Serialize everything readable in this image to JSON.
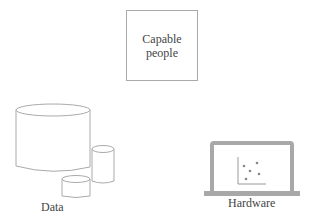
{
  "nodes": {
    "people": {
      "line1": "Capable",
      "line2": "people"
    },
    "data": {
      "label": "Data"
    },
    "hardware": {
      "label": "Hardware"
    }
  },
  "colors": {
    "stroke": "#aaaaaa",
    "laptop": "#a8a8a8",
    "dots": "#888888"
  }
}
